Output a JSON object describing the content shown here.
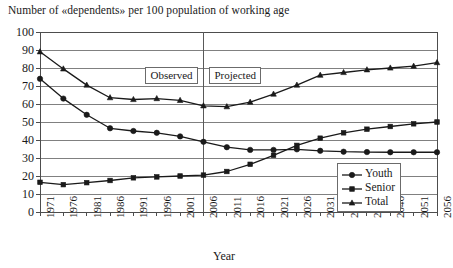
{
  "chart_data": {
    "type": "line",
    "title": "Number of «dependents» per 100 population of working age",
    "subtitle": "",
    "xlabel": "Year",
    "ylabel": "",
    "ylim": [
      0,
      100
    ],
    "ytick_step": 10,
    "yticks": [
      "100",
      "90",
      "80",
      "70",
      "60",
      "50",
      "40",
      "30",
      "20",
      "10",
      "0"
    ],
    "grid": true,
    "legend_position": "lower-right",
    "x": [
      1971,
      1976,
      1981,
      1986,
      1991,
      1996,
      2001,
      2006,
      2011,
      2016,
      2021,
      2026,
      2031,
      2036,
      2041,
      2046,
      2051,
      2056
    ],
    "categories": [
      "1971",
      "1976",
      "1981",
      "1986",
      "1991",
      "1996",
      "2001",
      "2006",
      "2011",
      "2016",
      "2021",
      "2026",
      "2031",
      "2036",
      "2041",
      "2046",
      "2051",
      "2056"
    ],
    "series": [
      {
        "name": "Youth",
        "marker": "circle",
        "color": "#1a1a1a",
        "values": [
          74,
          63,
          54,
          46.5,
          45,
          44,
          42,
          39,
          36,
          34.5,
          34.5,
          34.8,
          34,
          33.5,
          33.3,
          33.2,
          33.2,
          33.2
        ]
      },
      {
        "name": "Senior",
        "marker": "square",
        "color": "#1a1a1a",
        "values": [
          16.5,
          15.2,
          16.3,
          17.5,
          19,
          19.5,
          20,
          20.5,
          22.5,
          26.5,
          31.5,
          37,
          41,
          44,
          46,
          47.5,
          49,
          50
        ]
      },
      {
        "name": "Total",
        "marker": "triangle",
        "color": "#1a1a1a",
        "values": [
          89,
          79.5,
          70.5,
          63.5,
          62.5,
          63,
          62,
          59,
          58.5,
          61,
          65.5,
          70.5,
          76,
          77.5,
          79,
          80,
          81,
          83
        ]
      }
    ],
    "annotations": [
      {
        "text": "Observed",
        "type": "boxed-label",
        "x_range": [
          1971,
          2006
        ]
      },
      {
        "text": "Projected",
        "type": "boxed-label",
        "x_range": [
          2006,
          2056
        ]
      },
      {
        "text": "",
        "type": "divider",
        "x": 2006
      }
    ],
    "legend": [
      {
        "label": "Youth",
        "marker": "circle"
      },
      {
        "label": "Senior",
        "marker": "square"
      },
      {
        "label": "Total",
        "marker": "triangle"
      }
    ],
    "colors": {
      "line": "#1a1a1a",
      "grid": "#808080",
      "axis": "#4d4d4d",
      "divider": "#595959",
      "background": "#ffffff"
    }
  }
}
